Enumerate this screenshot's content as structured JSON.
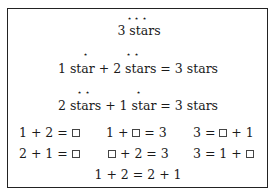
{
  "section1": {
    "stars": "⋆ ⋆ ⋆",
    "label": "3 stars"
  },
  "section2": {
    "stars_left": "⋆",
    "stars_right": "⋆ ⋆",
    "equation": "1 star + 2 stars = 3 stars"
  },
  "section3": {
    "stars_left": "⋆ ⋆",
    "stars_right": "⋆",
    "equation": "2 stars + 1 star = 3 stars"
  },
  "grid": {
    "row1": [
      {
        "pre": "1 + 2 = ",
        "post": ""
      },
      {
        "pre": "1 + ",
        "post": " = 3"
      },
      {
        "pre": "3 = ",
        "post": " + 1"
      }
    ],
    "row2": [
      {
        "pre": "2 + 1 = ",
        "post": ""
      },
      {
        "pre": "",
        "post": " + 2 = 3"
      },
      {
        "pre": "3 = 1 + ",
        "post": ""
      }
    ]
  },
  "final_equation": "1 + 2 = 2 + 1"
}
